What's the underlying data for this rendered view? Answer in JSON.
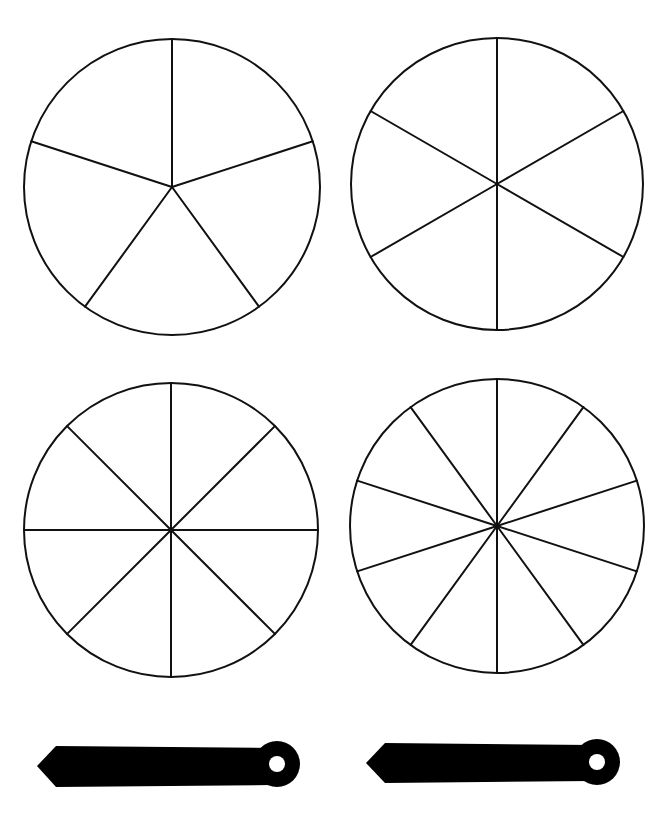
{
  "page": {
    "background": "#ffffff",
    "line_color": "#111111",
    "pointer_color": "#000000"
  },
  "spinners": [
    {
      "name": "spinner-5-sections",
      "sections": 5,
      "cx": 172,
      "cy": 187,
      "r": 148,
      "start_angle_deg": -90
    },
    {
      "name": "spinner-6-sections",
      "sections": 6,
      "cx": 497,
      "cy": 184,
      "r": 146,
      "start_angle_deg": -90
    },
    {
      "name": "spinner-8-sections",
      "sections": 8,
      "cx": 171,
      "cy": 530,
      "r": 147,
      "start_angle_deg": -90
    },
    {
      "name": "spinner-10-sections",
      "sections": 10,
      "cx": 497,
      "cy": 526,
      "r": 147,
      "start_angle_deg": -90
    }
  ],
  "pointers": [
    {
      "name": "pointer-left",
      "tip_x": 37,
      "tip_y": 766,
      "body_left": 56,
      "body_right": 272,
      "body_top": 746,
      "body_bottom": 787,
      "hub_cx": 277,
      "hub_cy": 764,
      "hub_r": 23,
      "hole_r": 8
    },
    {
      "name": "pointer-right",
      "tip_x": 366,
      "tip_y": 763,
      "body_left": 385,
      "body_right": 592,
      "body_top": 743,
      "body_bottom": 783,
      "hub_cx": 597,
      "hub_cy": 762,
      "hub_r": 23,
      "hole_r": 8
    }
  ]
}
